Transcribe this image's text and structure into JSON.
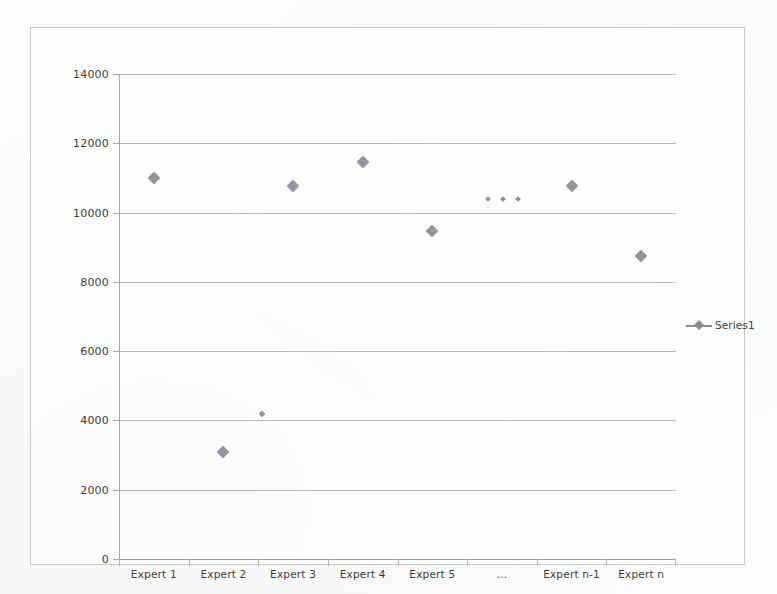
{
  "chart_data": {
    "type": "scatter",
    "title": "",
    "xlabel": "",
    "ylabel": "",
    "categories": [
      "Expert 1",
      "Expert 2",
      "Expert 3",
      "Expert 4",
      "Expert 5",
      "...",
      "Expert n-1",
      "Expert n"
    ],
    "series": [
      {
        "name": "Series1",
        "values": [
          11000,
          3100,
          10780,
          11450,
          9470,
          null,
          10780,
          8750
        ]
      }
    ],
    "extra_points": [
      {
        "label": "small point between Expert 2 and Expert 3",
        "x_fraction": 0.256,
        "value": 4200,
        "marker": "small"
      }
    ],
    "ellipsis_points": [
      {
        "x_fraction": 0.662,
        "value": 10400
      },
      {
        "x_fraction": 0.689,
        "value": 10400
      },
      {
        "x_fraction": 0.716,
        "value": 10400
      }
    ],
    "ylim": [
      0,
      14000
    ],
    "y_ticks": [
      0,
      2000,
      4000,
      6000,
      8000,
      10000,
      12000,
      14000
    ],
    "y_tick_labels": [
      "0",
      "2000",
      "4000",
      "6000",
      "8000",
      "10000",
      "12000",
      "14000"
    ],
    "grid": true,
    "legend_position": "right",
    "marker_shape": "diamond",
    "series_color": "#8b8b96",
    "gridline_color": "#b9b9b9",
    "axis_color": "#a8a8a8",
    "frame_color": "#c9c9c9",
    "text_color": "#3b3b3b"
  },
  "legend": {
    "entries": [
      {
        "label": "Series1",
        "marker": "diamond-line"
      }
    ]
  }
}
